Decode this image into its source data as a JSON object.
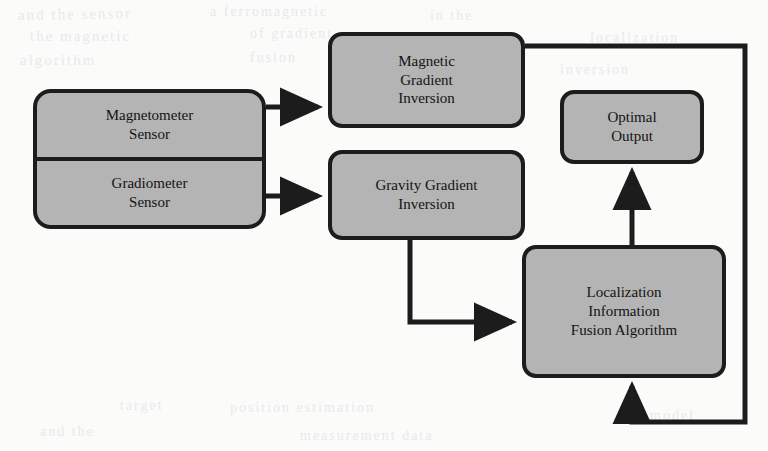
{
  "diagram": {
    "background_color": "#fbfbfa",
    "node_fill_color": "#b4b4b4",
    "node_border_color": "#1c1c1c",
    "nodes": [
      {
        "id": "magnetometer-sensor",
        "lines": [
          "Magnetometer",
          "Sensor"
        ]
      },
      {
        "id": "gradiometer-sensor",
        "lines": [
          "Gradiometer",
          "Sensor"
        ]
      },
      {
        "id": "magnetic-gradient-inversion",
        "lines": [
          "Magnetic",
          "Gradient",
          "Inversion"
        ]
      },
      {
        "id": "gravity-gradient-inversion",
        "lines": [
          "Gravity Gradient",
          "Inversion"
        ]
      },
      {
        "id": "optimal-output",
        "lines": [
          "Optimal",
          "Output"
        ]
      },
      {
        "id": "localization-information-fusion-algorithm",
        "lines": [
          "Localization",
          "Information",
          "Fusion Algorithm"
        ]
      }
    ],
    "connections": [
      {
        "id": "magnetometer-to-magnetic-inversion",
        "from": "magnetometer-sensor",
        "to": "magnetic-gradient-inversion",
        "arrow": true
      },
      {
        "id": "gradiometer-to-gravity-inversion",
        "from": "gradiometer-sensor",
        "to": "gravity-gradient-inversion",
        "arrow": true
      },
      {
        "id": "gravity-inversion-to-fusion",
        "from": "gravity-gradient-inversion",
        "to": "localization-information-fusion-algorithm",
        "arrow": true
      },
      {
        "id": "magnetic-inversion-to-feedback-bus",
        "from": "magnetic-gradient-inversion",
        "to": "localization-information-fusion-algorithm",
        "arrow": true
      },
      {
        "id": "fusion-to-optimal-output",
        "from": "localization-information-fusion-algorithm",
        "to": "optimal-output",
        "arrow": true
      }
    ],
    "smudges": [
      {
        "text": "and the sensor",
        "x": 18,
        "y": 6,
        "size": 15,
        "rotate": -1
      },
      {
        "text": "a ferromagnetic",
        "x": 210,
        "y": 4,
        "size": 14,
        "rotate": 0
      },
      {
        "text": "in the",
        "x": 430,
        "y": 8,
        "size": 14,
        "rotate": 0
      },
      {
        "text": "the magnetic",
        "x": 30,
        "y": 28,
        "size": 15,
        "rotate": 0
      },
      {
        "text": "of gradient",
        "x": 250,
        "y": 26,
        "size": 14,
        "rotate": 0
      },
      {
        "text": "localization",
        "x": 590,
        "y": 30,
        "size": 14,
        "rotate": 0
      },
      {
        "text": "algorithm",
        "x": 20,
        "y": 52,
        "size": 15,
        "rotate": 0
      },
      {
        "text": "fusion",
        "x": 250,
        "y": 50,
        "size": 14,
        "rotate": 0
      },
      {
        "text": "inversion",
        "x": 560,
        "y": 62,
        "size": 14,
        "rotate": 0
      },
      {
        "text": "target",
        "x": 120,
        "y": 398,
        "size": 14,
        "rotate": 0
      },
      {
        "text": "position estimation",
        "x": 230,
        "y": 400,
        "size": 14,
        "rotate": 0
      },
      {
        "text": "and the",
        "x": 40,
        "y": 424,
        "size": 14,
        "rotate": 0
      },
      {
        "text": "measurement data",
        "x": 300,
        "y": 428,
        "size": 14,
        "rotate": 0
      },
      {
        "text": "model",
        "x": 650,
        "y": 408,
        "size": 14,
        "rotate": 0
      }
    ]
  }
}
